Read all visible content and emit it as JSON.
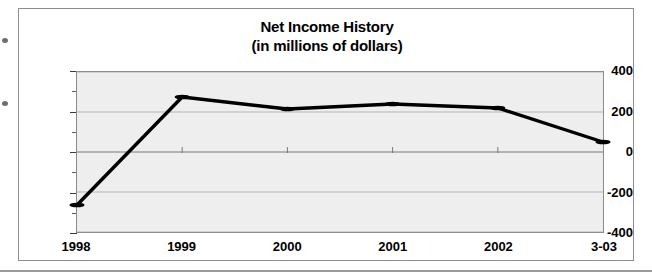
{
  "chart_data": {
    "type": "line",
    "title": "Net Income History",
    "subtitle": "(in millions of dollars)",
    "xlabel": "",
    "ylabel": "",
    "categories": [
      "1998",
      "1999",
      "2000",
      "2001",
      "2002",
      "3-03"
    ],
    "values": [
      -265,
      275,
      215,
      240,
      220,
      50
    ],
    "series": [
      {
        "name": "Net Income",
        "values": [
          -265,
          275,
          215,
          240,
          220,
          50
        ]
      }
    ],
    "ylim": [
      -400,
      400
    ],
    "y_ticks": [
      400,
      200,
      0,
      -200,
      -400
    ],
    "y_tick_labels": [
      "400",
      "200",
      "0",
      "-200",
      "-400"
    ],
    "y_minor_ticks": [
      300,
      100,
      -100,
      -300
    ],
    "grid": true,
    "grid_axis": "y",
    "legend": false,
    "legend_position": "none",
    "marker": "circle",
    "marker_color": "#000000",
    "line_color": "#000000",
    "plot_background": "#eeeeee",
    "figure_background": "#ffffff"
  },
  "figure": {
    "border_color": "#8e8e8e"
  }
}
